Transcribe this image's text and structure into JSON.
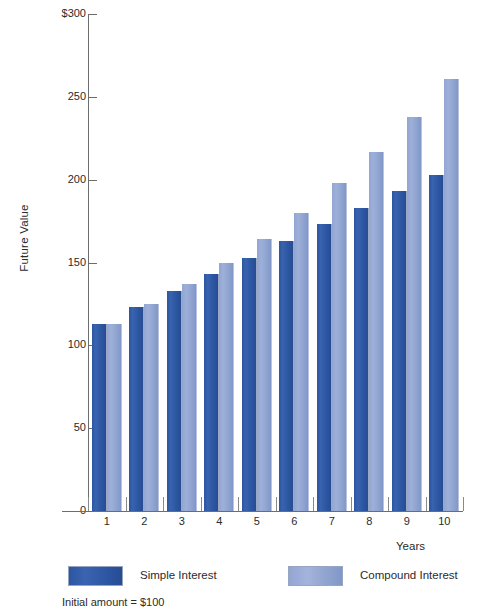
{
  "chart_data": {
    "type": "bar",
    "title": "",
    "xlabel": "Years",
    "ylabel": "Future Value",
    "categories": [
      "1",
      "2",
      "3",
      "4",
      "5",
      "6",
      "7",
      "8",
      "9",
      "10"
    ],
    "series": [
      {
        "name": "Simple Interest",
        "color": "#2c55a2",
        "values": [
          113,
          123,
          133,
          143,
          153,
          163,
          173,
          183,
          193,
          203
        ]
      },
      {
        "name": "Compound Interest",
        "color": "#93a6d2",
        "values": [
          113,
          125,
          137,
          150,
          164,
          180,
          198,
          217,
          238,
          261
        ]
      }
    ],
    "ylim": [
      0,
      300
    ],
    "y_ticks": [
      {
        "value": 300,
        "label": "$300"
      },
      {
        "value": 250,
        "label": "250"
      },
      {
        "value": 200,
        "label": "200"
      },
      {
        "value": 150,
        "label": "150"
      },
      {
        "value": 100,
        "label": "100"
      },
      {
        "value": 50,
        "label": "50"
      },
      {
        "value": 0,
        "label": "0"
      }
    ],
    "grid": false,
    "legend_position": "bottom",
    "annotation": "Initial amount = $100"
  },
  "axes": {
    "y_title": "Future Value",
    "x_title": "Years"
  },
  "legend": {
    "items": [
      {
        "label": "Simple Interest",
        "key": "simple"
      },
      {
        "label": "Compound Interest",
        "key": "compound"
      }
    ]
  },
  "footnote": "Initial amount = $100",
  "colors": {
    "simple": "#2c55a2",
    "compound": "#93a6d2",
    "axis": "#6d6d6d",
    "text": "#2b2b2b"
  }
}
